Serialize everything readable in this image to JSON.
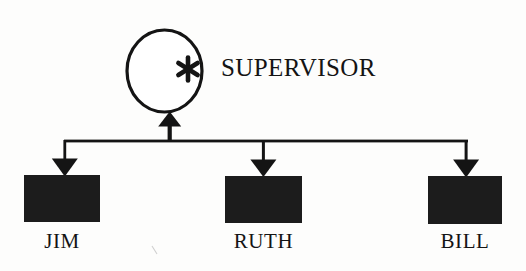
{
  "diagram": {
    "type": "process-hierarchy",
    "background_color": "#fdfdfc",
    "ink_color": "#141414",
    "supervisor": {
      "label": "SUPERVISOR",
      "shape": "circle",
      "marker": "*",
      "marker_name": "asterisk-marker",
      "fill": "#ffffff",
      "stroke": "#141414"
    },
    "bus": {
      "name": "horizontal-connector-bus",
      "direction": "up-into-supervisor"
    },
    "nodes": [
      {
        "label": "JIM",
        "shape": "filled-rectangle",
        "fill": "#1c1c1c",
        "arrow": "down"
      },
      {
        "label": "RUTH",
        "shape": "filled-rectangle",
        "fill": "#1c1c1c",
        "arrow": "down"
      },
      {
        "label": "BILL",
        "shape": "filled-rectangle",
        "fill": "#1c1c1c",
        "arrow": "down"
      }
    ]
  }
}
